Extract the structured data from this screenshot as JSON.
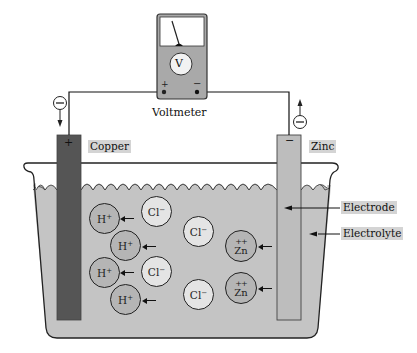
{
  "diagram": {
    "voltmeter": {
      "label": "Voltmeter",
      "dial_symbol": "V",
      "positive_terminal": "+",
      "negative_terminal": "−"
    },
    "electrodes": {
      "copper": {
        "label": "Copper",
        "polarity": "+",
        "color": "#555555"
      },
      "zinc": {
        "label": "Zinc",
        "polarity": "−",
        "color": "#bdbdbd"
      }
    },
    "electron_flow": {
      "left_symbol": "⊖",
      "right_symbol": "⊖",
      "left_direction": "down",
      "right_direction": "up"
    },
    "callouts": {
      "electrode": "Electrode",
      "electrolyte": "Electrolyte"
    },
    "ions": [
      {
        "type": "H",
        "label": "H",
        "charge": "+",
        "x": 89,
        "y": 203,
        "arrow": true
      },
      {
        "type": "H",
        "label": "H",
        "charge": "+",
        "x": 110,
        "y": 230,
        "arrow": true
      },
      {
        "type": "H",
        "label": "H",
        "charge": "+",
        "x": 89,
        "y": 257,
        "arrow": true
      },
      {
        "type": "H",
        "label": "H",
        "charge": "+",
        "x": 110,
        "y": 284,
        "arrow": true
      },
      {
        "type": "Cl",
        "label": "Cl",
        "charge": "−",
        "x": 141,
        "y": 196
      },
      {
        "type": "Cl",
        "label": "Cl",
        "charge": "−",
        "x": 141,
        "y": 256
      },
      {
        "type": "Cl",
        "label": "Cl",
        "charge": "−",
        "x": 183,
        "y": 216
      },
      {
        "type": "Cl",
        "label": "Cl",
        "charge": "−",
        "x": 183,
        "y": 279
      },
      {
        "type": "Zn",
        "label": "Zn",
        "charge": "++",
        "x": 225,
        "y": 230,
        "arrow": true
      },
      {
        "type": "Zn",
        "label": "Zn",
        "charge": "++",
        "x": 225,
        "y": 272,
        "arrow": true
      }
    ],
    "colors": {
      "electrolyte": "#c4c4c4",
      "copper": "#555555",
      "zinc": "#bdbdbd",
      "label_bg": "#d4d4d4",
      "voltmeter_body": "#a9a9a9"
    }
  }
}
